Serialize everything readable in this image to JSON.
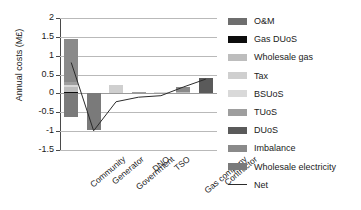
{
  "chart_data": {
    "type": "bar",
    "stacked": true,
    "title": "",
    "xlabel": "",
    "ylabel": "Annual costs (M£)",
    "ylim": [
      -1.5,
      2
    ],
    "yticks": [
      2,
      1.5,
      1,
      0.5,
      0,
      -0.5,
      -1,
      -1.5
    ],
    "ytick_labels": [
      "2",
      "1.5",
      "1",
      "0.5",
      "0",
      "-0.5",
      "-1",
      "-1.5"
    ],
    "grid": true,
    "legend_position": "right",
    "categories": [
      "Community",
      "Generator",
      "Government",
      "DNO",
      "TSO",
      "Gas company",
      "Contractor"
    ],
    "series": [
      {
        "name": "O&M",
        "color": "#6e6e6e",
        "values": [
          0.0,
          0.0,
          0.0,
          0.0,
          0.0,
          0.0,
          0.0
        ]
      },
      {
        "name": "Gas DUoS",
        "color": "#0d0d0d",
        "values": [
          0.04,
          0.0,
          0.0,
          0.0,
          0.0,
          0.0,
          0.0
        ]
      },
      {
        "name": "Wholesale gas",
        "color": "#bdbdbd",
        "values": [
          0.13,
          0.0,
          0.0,
          0.0,
          0.0,
          0.05,
          0.0
        ]
      },
      {
        "name": "Tax",
        "color": "#cfcfcf",
        "values": [
          0.0,
          0.0,
          0.22,
          0.0,
          0.0,
          0.0,
          0.0
        ]
      },
      {
        "name": "BSUoS",
        "color": "#d9d9d9",
        "values": [
          0.06,
          0.0,
          0.0,
          0.0,
          0.05,
          0.0,
          0.0
        ]
      },
      {
        "name": "TUoS",
        "color": "#9e9e9e",
        "values": [
          0.06,
          0.0,
          0.0,
          0.05,
          0.0,
          0.0,
          0.0
        ]
      },
      {
        "name": "DUoS",
        "color": "#5a5a5a",
        "values": [
          0.0,
          0.0,
          0.0,
          0.0,
          0.0,
          0.0,
          0.4
        ]
      },
      {
        "name": "Imbalance",
        "color": "#8a8a8a",
        "values": [
          1.14,
          0.0,
          0.0,
          0.0,
          0.0,
          0.13,
          0.0
        ]
      },
      {
        "name": "Wholesale electricity",
        "color": "#7a7a7a",
        "values": [
          -0.62,
          -0.98,
          0.0,
          0.0,
          0.0,
          0.0,
          0.0
        ]
      }
    ],
    "net_line": {
      "name": "Net",
      "color": "#2b2b2b",
      "values": [
        0.82,
        -0.99,
        -0.22,
        -0.1,
        -0.06,
        0.17,
        0.38
      ]
    }
  },
  "legend": {
    "items": [
      {
        "label": "O&M",
        "swatch": "legend-swatch"
      },
      {
        "label": "Gas DUoS",
        "swatch": "legend-swatch"
      },
      {
        "label": "Wholesale gas",
        "swatch": "legend-swatch"
      },
      {
        "label": "Tax",
        "swatch": "legend-swatch"
      },
      {
        "label": "BSUoS",
        "swatch": "legend-swatch"
      },
      {
        "label": "TUoS",
        "swatch": "legend-swatch"
      },
      {
        "label": "DUoS",
        "swatch": "legend-swatch"
      },
      {
        "label": "Imbalance",
        "swatch": "legend-swatch"
      },
      {
        "label": "Wholesale electricity",
        "swatch": "legend-swatch"
      },
      {
        "label": "Net",
        "swatch": "legend-line"
      }
    ]
  }
}
